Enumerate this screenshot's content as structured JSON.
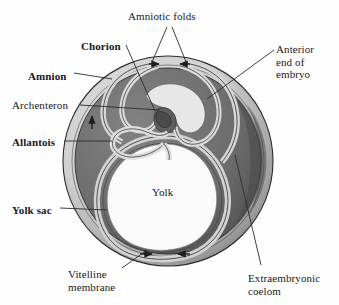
{
  "figure": {
    "background_color": "#fefefe"
  },
  "palette": {
    "shell_outer": "#d3d3d3",
    "shell_inner_dark": "#6f6f6f",
    "coelom_gray": "#6a6a6a",
    "membrane_light": "#cfcfcf",
    "membrane_pale": "#e2e2e2",
    "yolk_white": "#fafafa",
    "outline": "#2b2b2b",
    "leader_line": "#2b2b2b",
    "text": "#181818",
    "arrow_fill": "#1d1d1d"
  },
  "labels": [
    {
      "id": "amniotic-folds",
      "text": "Amniotic folds",
      "bold": false,
      "x": 128,
      "y": 10,
      "align": "left"
    },
    {
      "id": "chorion",
      "text": "Chorion",
      "bold": true,
      "x": 81,
      "y": 40,
      "align": "left"
    },
    {
      "id": "amnion",
      "text": "Amnion",
      "bold": true,
      "x": 28,
      "y": 70,
      "align": "left"
    },
    {
      "id": "archenteron",
      "text": "Archenteron",
      "bold": false,
      "x": 12,
      "y": 99,
      "align": "left"
    },
    {
      "id": "allantois",
      "text": "Allantois",
      "bold": true,
      "x": 12,
      "y": 136,
      "align": "left"
    },
    {
      "id": "yolk-sac",
      "text": "Yolk sac",
      "bold": true,
      "x": 12,
      "y": 204,
      "align": "left"
    },
    {
      "id": "yolk",
      "text": "Yolk",
      "bold": false,
      "x": 152,
      "y": 186,
      "align": "left"
    },
    {
      "id": "anterior-end-of-embryo",
      "text": "Anterior\nend of\nembryo",
      "bold": false,
      "x": 276,
      "y": 43,
      "align": "left"
    },
    {
      "id": "extraembryonic-coelom",
      "text": "Extraembryonic\ncoelom",
      "bold": false,
      "x": 248,
      "y": 272,
      "align": "left"
    },
    {
      "id": "vitelline-membrane",
      "text": "Vitelline\nmembrane",
      "bold": false,
      "x": 68,
      "y": 268,
      "align": "left"
    }
  ],
  "leader_lines": [
    {
      "id": "amniotic-folds-left",
      "from_label": "amniotic-folds",
      "path": "M 167 27 L 152 62"
    },
    {
      "id": "amniotic-folds-right",
      "from_label": "amniotic-folds",
      "path": "M 172 27 L 186 62"
    },
    {
      "id": "chorion-leader",
      "from_label": "chorion",
      "path": "M 126 45 L 155 111"
    },
    {
      "id": "amnion-leader",
      "from_label": "amnion",
      "path": "M 74 73 L 112 79"
    },
    {
      "id": "archenteron-leader",
      "from_label": "archenteron",
      "path": "M 80 105 L 160 110"
    },
    {
      "id": "allantois-leader",
      "from_label": "allantois",
      "path": "M 64 141 L 112 141"
    },
    {
      "id": "yolk-sac-leader",
      "from_label": "yolk-sac",
      "path": "M 60 208 L 107 210"
    },
    {
      "id": "anterior-leader",
      "from_label": "anterior-end-of-embryo",
      "path": "M 274 50 L 207 99"
    },
    {
      "id": "coelom-leader",
      "from_label": "extraembryonic-coelom",
      "path": "M 261 265 L 235 155"
    },
    {
      "id": "vitelline-leader",
      "from_label": "vitelline-membrane",
      "path": "M 122 268 L 147 250"
    }
  ],
  "arrows": [
    {
      "id": "amniotic-fold-arrow-left",
      "description": "fold closing arrow pointing right",
      "x": 155,
      "y": 64,
      "direction": "right"
    },
    {
      "id": "amniotic-fold-arrow-right",
      "description": "fold closing arrow pointing left",
      "x": 183,
      "y": 64,
      "direction": "left"
    },
    {
      "id": "allantois-growth-arrow",
      "description": "allantois expansion arrow pointing up",
      "x": 92,
      "y": 118,
      "direction": "up"
    },
    {
      "id": "yolk-sac-arrow-left",
      "description": "yolk sac growth arrow pointing right",
      "x": 148,
      "y": 254,
      "direction": "right"
    },
    {
      "id": "yolk-sac-arrow-right",
      "description": "yolk sac growth arrow pointing left",
      "x": 180,
      "y": 254,
      "direction": "left"
    }
  ],
  "structures": [
    {
      "id": "vitelline-membrane-shell",
      "name": "Vitelline membrane (outer shell)"
    },
    {
      "id": "extraembryonic-coelom-region",
      "name": "Extraembryonic coelom"
    },
    {
      "id": "chorion-membrane",
      "name": "Chorion"
    },
    {
      "id": "amnion-membrane",
      "name": "Amnion"
    },
    {
      "id": "allantois-tube",
      "name": "Allantois"
    },
    {
      "id": "yolk-sac-membrane",
      "name": "Yolk sac"
    },
    {
      "id": "yolk-mass",
      "name": "Yolk"
    },
    {
      "id": "embryo-body",
      "name": "Embryo"
    },
    {
      "id": "archenteron-cavity",
      "name": "Archenteron"
    }
  ]
}
